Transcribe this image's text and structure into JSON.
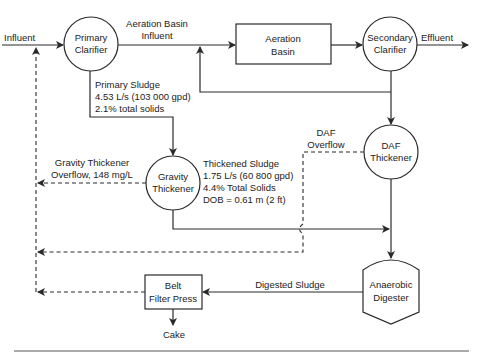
{
  "nodes": {
    "primary_clarifier": {
      "line1": "Primary",
      "line2": "Clarifier"
    },
    "aeration_basin": {
      "line1": "Aeration",
      "line2": "Basin"
    },
    "secondary_clarifier": {
      "line1": "Secondary",
      "line2": "Clarifier"
    },
    "daf_thickener": {
      "line1": "DAF",
      "line2": "Thickener"
    },
    "gravity_thickener": {
      "line1": "Gravity",
      "line2": "Thickener"
    },
    "anaerobic_digester": {
      "line1": "Anaerobic",
      "line2": "Digester"
    },
    "belt_filter_press": {
      "line1": "Belt",
      "line2": "Filter Press"
    }
  },
  "labels": {
    "influent": "Influent",
    "aeration_basin_influent_1": "Aeration Basin",
    "aeration_basin_influent_2": "Influent",
    "effluent": "Effluent",
    "primary_sludge_1": "Primary Sludge",
    "primary_sludge_2": "4.53 L/s (103 000 gpd)",
    "primary_sludge_3": "2.1% total solids",
    "gravity_overflow_1": "Gravity Thickener",
    "gravity_overflow_2": "Overflow, 148 mg/L",
    "thickened_sludge_1": "Thickened Sludge",
    "thickened_sludge_2": "1.75 L/s (60 800 gpd)",
    "thickened_sludge_3": "4.4% Total Solids",
    "thickened_sludge_4": "DOB = 0.61 m (2 ft)",
    "daf_overflow_1": "DAF",
    "daf_overflow_2": "Overflow",
    "digested_sludge": "Digested Sludge",
    "cake": "Cake"
  },
  "colors": {
    "line": "#2a2a2a",
    "text": "#222222",
    "background": "#ffffff"
  }
}
